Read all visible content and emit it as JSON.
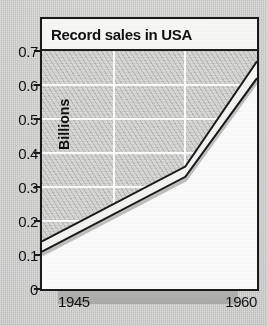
{
  "chart_data": {
    "type": "line",
    "title": "Record sales in USA",
    "xlabel": "",
    "ylabel": "Billions",
    "xlim": [
      1945,
      1960
    ],
    "ylim": [
      0,
      0.7
    ],
    "grid": true,
    "legend": "none",
    "x_tick_labels": [
      "1945",
      "1960"
    ],
    "y_tick_labels": [
      "0.7",
      "0.6",
      "0.5",
      "0.4",
      "0.3",
      "0.2",
      "0.1",
      "0"
    ],
    "y_tick_values": [
      0.7,
      0.6,
      0.5,
      0.4,
      0.3,
      0.2,
      0.1,
      0
    ],
    "x_gridline_values": [
      1950,
      1955
    ],
    "x": [
      1945,
      1955,
      1960
    ],
    "series": [
      {
        "name": "upper",
        "values": [
          0.14,
          0.36,
          0.67
        ]
      },
      {
        "name": "lower",
        "values": [
          0.11,
          0.33,
          0.62
        ]
      }
    ],
    "note": "Shaded band between two parallel trend lines rising from about 0.1 billion in 1945 to about 0.65 billion in 1960, with a steeper slope after 1955.",
    "colors": {
      "line": "#1a1a1a",
      "band_fill": "#f4f4f2",
      "plot_above_fill": "#d8d8d6",
      "plot_below_fill": "#fbfbfb",
      "gridline": "#ffffff",
      "page_background": "#c9c9c7",
      "title_background": "#f7f7f5"
    }
  },
  "chart": {
    "title": "Record sales in USA",
    "y_axis_label": "Billions",
    "y_ticks": [
      "0.7",
      "0.6",
      "0.5",
      "0.4",
      "0.3",
      "0.2",
      "0.1",
      "0"
    ],
    "x_ticks": [
      "1945",
      "1960"
    ]
  }
}
